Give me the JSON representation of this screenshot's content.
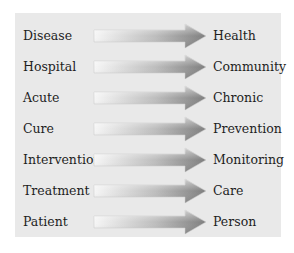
{
  "diagram": {
    "title": "",
    "rows": [
      {
        "from": "Disease",
        "to": "Health"
      },
      {
        "from": "Hospital",
        "to": "Community"
      },
      {
        "from": "Acute",
        "to": "Chronic"
      },
      {
        "from": "Cure",
        "to": "Prevention"
      },
      {
        "from": "Intervention",
        "to": "Monitoring"
      },
      {
        "from": "Treatment",
        "to": "Care"
      },
      {
        "from": "Patient",
        "to": "Person"
      }
    ],
    "arrow_icon": "right-arrow-icon",
    "colors": {
      "panel": "#e9e9e9",
      "arrow_start": "#f4f4f4",
      "arrow_end": "#8e8e8e",
      "text": "#1e1e1e"
    }
  }
}
